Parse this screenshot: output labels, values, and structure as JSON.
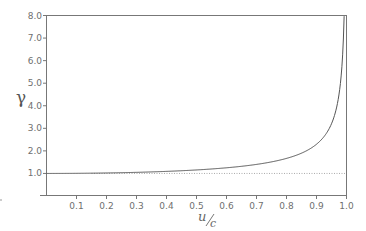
{
  "chart_data": {
    "type": "line",
    "title": "",
    "xlabel": "u/c",
    "ylabel": "γ",
    "xlim": [
      0,
      1.0
    ],
    "ylim": [
      0,
      8.0
    ],
    "x_ticks": [
      "0.1",
      "0.2",
      "0.3",
      "0.4",
      "0.5",
      "0.6",
      "0.7",
      "0.8",
      "0.9",
      "1.0"
    ],
    "y_ticks": [
      "1.0",
      "2.0",
      "3.0",
      "4.0",
      "5.0",
      "6.0",
      "7.0",
      "8.0"
    ],
    "grid": false,
    "legend": null,
    "series": [
      {
        "name": "gamma",
        "formula": "1/sqrt(1-(u/c)^2)",
        "style": "solid",
        "x": [
          0,
          0.1,
          0.2,
          0.3,
          0.4,
          0.5,
          0.6,
          0.7,
          0.8,
          0.85,
          0.9,
          0.95,
          0.97,
          0.98,
          0.99,
          0.992
        ],
        "y": [
          1.0,
          1.005,
          1.021,
          1.048,
          1.091,
          1.155,
          1.25,
          1.4,
          1.667,
          1.898,
          2.294,
          3.203,
          4.113,
          5.025,
          7.089,
          7.92
        ]
      },
      {
        "name": "gamma = 1 reference",
        "style": "dotted",
        "x": [
          0.15,
          1.0
        ],
        "y": [
          1.0,
          1.0
        ]
      }
    ]
  },
  "labels": {
    "gamma": "γ",
    "x_num": "u",
    "x_den": "c"
  }
}
